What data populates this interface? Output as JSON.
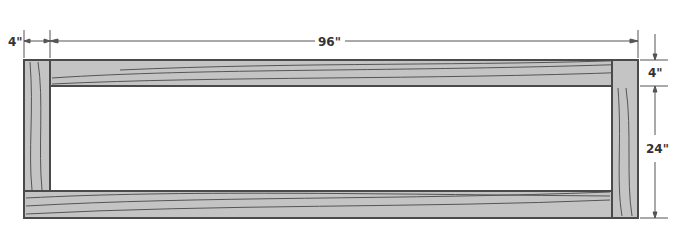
{
  "diagram": {
    "type": "frame-dimension-drawing",
    "dimensions": {
      "overall_width": "96\"",
      "post_width": "4\"",
      "rail_height": "4\"",
      "opening_height": "24\""
    },
    "colors": {
      "wood_fill": "#c4c4c4",
      "outline": "#4a4a4a",
      "grain": "#555555",
      "dimension_line": "#555555"
    }
  }
}
